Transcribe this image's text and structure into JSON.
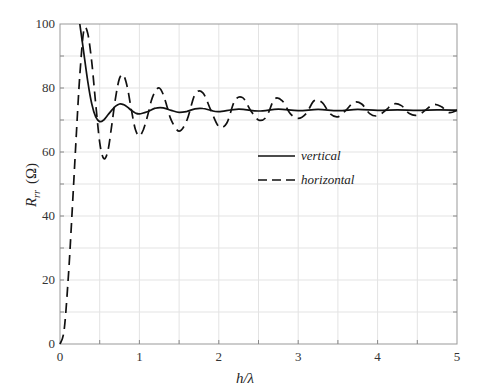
{
  "chart_data": {
    "type": "line",
    "title": "",
    "xlabel": "h/λ",
    "ylabel": "R_rr (Ω)",
    "ylabel_main": "R",
    "ylabel_sub": "rr",
    "ylabel_unit": "(Ω)",
    "xlim": [
      0,
      5
    ],
    "ylim": [
      0,
      100
    ],
    "xticks": [
      0,
      1,
      2,
      3,
      4,
      5
    ],
    "yticks": [
      0,
      20,
      40,
      60,
      80,
      100
    ],
    "xtick_labels": [
      "0",
      "1",
      "2",
      "3",
      "4",
      "5"
    ],
    "ytick_labels": [
      "0",
      "20",
      "40",
      "60",
      "80",
      "100"
    ],
    "grid": true,
    "grid_x": [
      0.5,
      1,
      1.5,
      2,
      2.5,
      3,
      3.5,
      4,
      4.5
    ],
    "grid_y": [
      10,
      20,
      30,
      40,
      50,
      60,
      70,
      80,
      90
    ],
    "legend": {
      "position": "center-right",
      "entries": [
        "vertical",
        "horizontal"
      ]
    },
    "series": [
      {
        "name": "vertical",
        "style": "solid",
        "x": [
          0.25,
          0.3,
          0.35,
          0.4,
          0.45,
          0.5,
          0.55,
          0.6,
          0.65,
          0.7,
          0.75,
          0.8,
          0.85,
          0.9,
          0.95,
          1.0,
          1.1,
          1.2,
          1.3,
          1.4,
          1.5,
          1.6,
          1.7,
          1.8,
          1.9,
          2.0,
          2.25,
          2.5,
          2.75,
          3.0,
          3.25,
          3.5,
          3.75,
          4.0,
          4.25,
          4.5,
          4.75,
          5.0
        ],
        "values": [
          100,
          91,
          82,
          75,
          71,
          69.5,
          70,
          71.5,
          73,
          74.3,
          75,
          74.8,
          74,
          73,
          72.2,
          71.9,
          72.6,
          73.7,
          73.8,
          73,
          72.4,
          72.7,
          73.5,
          73.6,
          73,
          72.6,
          73.4,
          72.8,
          73.4,
          72.9,
          73.3,
          72.9,
          73.3,
          73,
          73.2,
          73,
          73.2,
          73.1
        ]
      },
      {
        "name": "horizontal",
        "style": "dashed",
        "x": [
          0,
          0.05,
          0.1,
          0.15,
          0.2,
          0.25,
          0.3,
          0.35,
          0.4,
          0.45,
          0.5,
          0.55,
          0.6,
          0.65,
          0.7,
          0.75,
          0.8,
          0.85,
          0.9,
          0.95,
          1.0,
          1.05,
          1.1,
          1.15,
          1.2,
          1.25,
          1.3,
          1.35,
          1.4,
          1.5,
          1.6,
          1.7,
          1.8,
          1.9,
          2.0,
          2.1,
          2.2,
          2.3,
          2.4,
          2.5,
          2.6,
          2.7,
          2.8,
          2.9,
          3.0,
          3.1,
          3.2,
          3.3,
          3.4,
          3.5,
          3.6,
          3.7,
          3.8,
          3.9,
          4.0,
          4.1,
          4.2,
          4.3,
          4.4,
          4.5,
          4.6,
          4.7,
          4.8,
          4.9,
          5.0
        ],
        "values": [
          0,
          4,
          19,
          40,
          63,
          84,
          98,
          97,
          88,
          75,
          63,
          58,
          60,
          68,
          77,
          83,
          84,
          80,
          73,
          67,
          65,
          67,
          71,
          76,
          79,
          80,
          78,
          74,
          70,
          66.5,
          70,
          78,
          78.5,
          73,
          68,
          69,
          76,
          77,
          73,
          70,
          71,
          76.5,
          76,
          72,
          70.5,
          72,
          76,
          75.5,
          72,
          71,
          73,
          75.5,
          75,
          72,
          71.3,
          73,
          75,
          74.5,
          72,
          71.5,
          73,
          74.8,
          74.2,
          72.3,
          73
        ]
      }
    ]
  }
}
